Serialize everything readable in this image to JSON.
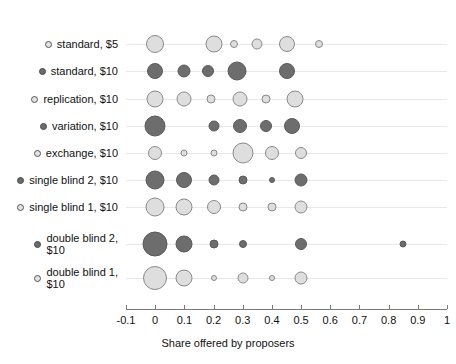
{
  "chart_data": {
    "type": "scatter",
    "title": "",
    "xlabel": "Share offered by proposers",
    "ylabel": "",
    "xlim": [
      -0.1,
      1
    ],
    "xticks": [
      -0.1,
      0,
      0.1,
      0.2,
      0.3,
      0.4,
      0.5,
      0.6,
      0.7,
      0.8,
      0.9,
      1
    ],
    "xtick_labels": [
      "-0.1",
      "0",
      "0.1",
      "0.2",
      "0.3",
      "0.4",
      "0.5",
      "0.6",
      "0.7",
      "0.8",
      "0.9",
      "1"
    ],
    "grid": true,
    "legend_position": "none",
    "note": "Bubble (balloon) plot; bubble area encodes relative frequency of each offered share within a treatment row.",
    "categories": [
      "standard, $5",
      "standard, $10",
      "replication, $10",
      "variation, $10",
      "exchange, $10",
      "single blind 2, $10",
      "single blind 1, $10",
      "double blind 2, $10",
      "double blind 1, $10"
    ],
    "series": [
      {
        "name": "standard, $5",
        "shade": "light",
        "points": [
          {
            "x": 0.0,
            "size": 18
          },
          {
            "x": 0.2,
            "size": 17
          },
          {
            "x": 0.27,
            "size": 8
          },
          {
            "x": 0.35,
            "size": 11
          },
          {
            "x": 0.45,
            "size": 16
          },
          {
            "x": 0.56,
            "size": 8
          }
        ]
      },
      {
        "name": "standard, $10",
        "shade": "dark",
        "points": [
          {
            "x": 0.0,
            "size": 16
          },
          {
            "x": 0.1,
            "size": 13
          },
          {
            "x": 0.18,
            "size": 12
          },
          {
            "x": 0.28,
            "size": 19
          },
          {
            "x": 0.45,
            "size": 16
          }
        ]
      },
      {
        "name": "replication, $10",
        "shade": "light",
        "points": [
          {
            "x": 0.0,
            "size": 17
          },
          {
            "x": 0.1,
            "size": 15
          },
          {
            "x": 0.19,
            "size": 9
          },
          {
            "x": 0.29,
            "size": 15
          },
          {
            "x": 0.38,
            "size": 9
          },
          {
            "x": 0.48,
            "size": 17
          }
        ]
      },
      {
        "name": "variation, $10",
        "shade": "dark",
        "points": [
          {
            "x": 0.0,
            "size": 21
          },
          {
            "x": 0.2,
            "size": 11
          },
          {
            "x": 0.29,
            "size": 14
          },
          {
            "x": 0.38,
            "size": 12
          },
          {
            "x": 0.47,
            "size": 16
          }
        ]
      },
      {
        "name": "exchange, $10",
        "shade": "light",
        "points": [
          {
            "x": 0.0,
            "size": 14
          },
          {
            "x": 0.1,
            "size": 7
          },
          {
            "x": 0.2,
            "size": 7
          },
          {
            "x": 0.3,
            "size": 21
          },
          {
            "x": 0.4,
            "size": 14
          },
          {
            "x": 0.5,
            "size": 12
          }
        ]
      },
      {
        "name": "single blind 2, $10",
        "shade": "dark",
        "points": [
          {
            "x": 0.0,
            "size": 19
          },
          {
            "x": 0.1,
            "size": 16
          },
          {
            "x": 0.2,
            "size": 11
          },
          {
            "x": 0.3,
            "size": 9
          },
          {
            "x": 0.4,
            "size": 6
          },
          {
            "x": 0.5,
            "size": 13
          }
        ]
      },
      {
        "name": "single blind 1, $10",
        "shade": "light",
        "points": [
          {
            "x": 0.0,
            "size": 19
          },
          {
            "x": 0.1,
            "size": 17
          },
          {
            "x": 0.2,
            "size": 14
          },
          {
            "x": 0.3,
            "size": 9
          },
          {
            "x": 0.4,
            "size": 9
          },
          {
            "x": 0.5,
            "size": 13
          }
        ]
      },
      {
        "name": "double blind 2, $10",
        "shade": "dark",
        "points": [
          {
            "x": 0.0,
            "size": 25
          },
          {
            "x": 0.1,
            "size": 17
          },
          {
            "x": 0.2,
            "size": 9
          },
          {
            "x": 0.3,
            "size": 8
          },
          {
            "x": 0.5,
            "size": 12
          },
          {
            "x": 0.85,
            "size": 7
          }
        ]
      },
      {
        "name": "double blind 1, $10",
        "shade": "light",
        "points": [
          {
            "x": 0.0,
            "size": 24
          },
          {
            "x": 0.1,
            "size": 17
          },
          {
            "x": 0.2,
            "size": 6
          },
          {
            "x": 0.3,
            "size": 11
          },
          {
            "x": 0.4,
            "size": 6
          },
          {
            "x": 0.5,
            "size": 13
          }
        ]
      }
    ]
  },
  "axis": {
    "x_title": "Share offered by proposers"
  },
  "labels": {
    "rows": [
      {
        "text": "standard, $5",
        "shade": "light"
      },
      {
        "text": "standard, $10",
        "shade": "dark"
      },
      {
        "text": "replication, $10",
        "shade": "light"
      },
      {
        "text": "variation, $10",
        "shade": "dark"
      },
      {
        "text": "exchange, $10",
        "shade": "light"
      },
      {
        "text": "single blind 2, $10",
        "shade": "dark"
      },
      {
        "text": "single blind 1, $10",
        "shade": "light"
      },
      {
        "text": "double blind 2,\n$10",
        "shade": "dark"
      },
      {
        "text": "double blind 1,\n$10",
        "shade": "light"
      }
    ]
  }
}
